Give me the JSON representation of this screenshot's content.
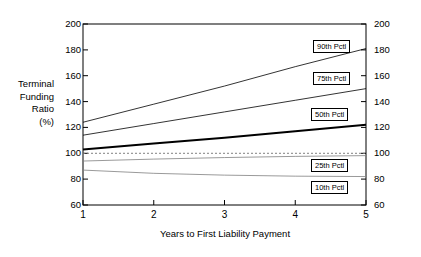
{
  "chart_data": {
    "type": "line",
    "title": "",
    "xlabel": "Years to First Liability Payment",
    "ylabel": "Terminal Funding Ratio (%)",
    "ylabel_lines": [
      "Terminal",
      "Funding",
      "Ratio",
      "(%)"
    ],
    "x": [
      1,
      2,
      3,
      4,
      5
    ],
    "xlim": [
      1,
      5
    ],
    "ylim": [
      60,
      200
    ],
    "xticks": [
      "1",
      "2",
      "3",
      "4",
      "5"
    ],
    "yticks": [
      "60",
      "80",
      "100",
      "120",
      "140",
      "160",
      "180",
      "200"
    ],
    "yticks_right": [
      "60",
      "80",
      "100",
      "120",
      "140",
      "160",
      "180",
      "200"
    ],
    "grid": false,
    "legend_position": "inline-callouts-right",
    "series": [
      {
        "name": "90th Pctl",
        "label": "90th Pctl",
        "values": [
          124,
          138,
          152,
          167,
          181
        ],
        "color": "#000000",
        "width": 0.8
      },
      {
        "name": "75th Pctl",
        "label": "75th Pctl",
        "values": [
          114,
          123,
          132,
          141,
          150
        ],
        "color": "#000000",
        "width": 0.8
      },
      {
        "name": "50th Pctl",
        "label": "50th Pctl",
        "values": [
          103,
          107.5,
          112,
          117,
          122
        ],
        "color": "#000000",
        "width": 2.0
      },
      {
        "name": "25th Pctl",
        "label": "25th Pctl",
        "values": [
          94,
          95.5,
          96.7,
          97.6,
          98.2
        ],
        "color": "#808080",
        "width": 0.8
      },
      {
        "name": "10th Pctl",
        "label": "10th Pctl",
        "values": [
          87,
          84.5,
          83.1,
          82.3,
          82
        ],
        "color": "#808080",
        "width": 0.8
      }
    ],
    "reference_line": {
      "name": "100 percent reference",
      "value": 100,
      "style": "dotted",
      "color": "#808080"
    },
    "annotations": []
  },
  "axes": {
    "left_title_lines": [
      "Terminal",
      "Funding",
      "Ratio",
      "(%)"
    ],
    "x_title": "Years to First Liability Payment"
  }
}
